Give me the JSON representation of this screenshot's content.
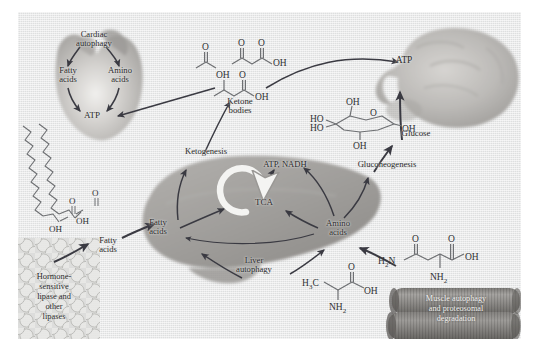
{
  "figure": {
    "type": "biological-pathway-diagram",
    "background_color": "#eceded",
    "panel_border_color": "#ffffff",
    "text_color": "#2a2a2a",
    "arrow_color": "#3a3a42"
  },
  "organs": {
    "heart": {
      "name": "heart",
      "fill": "#b9b7b4",
      "labels": {
        "process": "Cardiac\nautophagy",
        "substrate_left": "Fatty\nacids",
        "substrate_right": "Amino\nacids",
        "product": "ATP"
      }
    },
    "brain": {
      "name": "brain",
      "fill": "#b4b2af",
      "labels": {
        "product": "ATP"
      }
    },
    "liver": {
      "name": "liver",
      "fill": "#a8a6a4",
      "labels": {
        "ketogenesis": "Ketogenesis",
        "energy": "ATP, NADH",
        "cycle": "TCA",
        "fatty_acids": "Fatty\nacids",
        "amino_acids": "Amino\nacids",
        "autophagy": "Liver\nautophagy",
        "gluconeogenesis": "Gluconeogenesis"
      }
    },
    "adipose": {
      "name": "adipose-tissue",
      "fill": "#d2d2d0",
      "labels": {
        "caption": "Hormone-\nsensitive\nlipase and\nother\nlipases"
      }
    },
    "muscle": {
      "name": "skeletal-muscle",
      "fill": "#8f8d8a",
      "labels": {
        "caption": "Muscle autophagy\nand proteosomal\ndegradation"
      }
    }
  },
  "metabolites": {
    "ketone_bodies": {
      "label": "Ketone\nbodies",
      "structures": [
        "acetone",
        "acetoacetate",
        "beta-hydroxybutyrate"
      ],
      "atoms": {
        "o1": "O",
        "o2": "O",
        "o3": "O",
        "oh1": "OH",
        "oh2": "OH",
        "oh3": "OH",
        "o4": "O"
      }
    },
    "glucose": {
      "label": "Glucose",
      "structure": "glucopyranose",
      "atoms": {
        "ho_top": "HO",
        "ho_bottom": "HO",
        "oh_upper": "OH",
        "ring_o": "O",
        "oh_right": "OH",
        "oh_bottom": "OH"
      }
    },
    "fatty_acids": {
      "label": "Fatty\nacids",
      "structure": "long-chain-fatty-acid",
      "atoms": {
        "o_a": "O",
        "oh_a": "OH",
        "o_b": "O",
        "oh_b": "OH"
      }
    },
    "alanine": {
      "structure": "alanine",
      "atoms": {
        "methyl": "H",
        "methyl_sub": "3",
        "methyl_c": "C",
        "carbonyl_o": "O",
        "hydroxyl": "OH",
        "amine": "NH",
        "amine_sub": "2"
      }
    },
    "glutamine": {
      "structure": "glutamine",
      "atoms": {
        "amide_h2n": "H",
        "amide_sub": "2",
        "amide_n": "N",
        "o_left": "O",
        "o_right": "O",
        "hydroxyl": "OH",
        "amine": "NH",
        "amine_sub": "2"
      }
    }
  },
  "arrows": [
    {
      "from": "ketone-bodies",
      "to": "heart-atp"
    },
    {
      "from": "ketone-bodies",
      "to": "brain-atp"
    },
    {
      "from": "liver-ketogenesis",
      "to": "ketone-bodies"
    },
    {
      "from": "glucose",
      "to": "brain-atp"
    },
    {
      "from": "liver-gluconeogenesis",
      "to": "glucose"
    },
    {
      "from": "adipose-lipases",
      "to": "fatty-acids"
    },
    {
      "from": "fatty-acids",
      "to": "liver-fatty-acids"
    },
    {
      "from": "muscle",
      "to": "liver-amino-acids"
    },
    {
      "from": "liver-autophagy",
      "to": "liver-fatty-acids"
    },
    {
      "from": "liver-autophagy",
      "to": "liver-amino-acids"
    },
    {
      "from": "liver-fatty-acids",
      "to": "tca"
    },
    {
      "from": "liver-amino-acids",
      "to": "tca"
    },
    {
      "from": "tca",
      "to": "atp-nadh"
    },
    {
      "from": "liver-fatty-acids",
      "to": "ketogenesis"
    },
    {
      "from": "liver-amino-acids",
      "to": "gluconeogenesis"
    },
    {
      "from": "cardiac-autophagy",
      "to": "heart-fatty-acids"
    },
    {
      "from": "cardiac-autophagy",
      "to": "heart-amino-acids"
    },
    {
      "from": "heart-fatty-acids",
      "to": "heart-atp"
    },
    {
      "from": "heart-amino-acids",
      "to": "heart-atp"
    }
  ]
}
